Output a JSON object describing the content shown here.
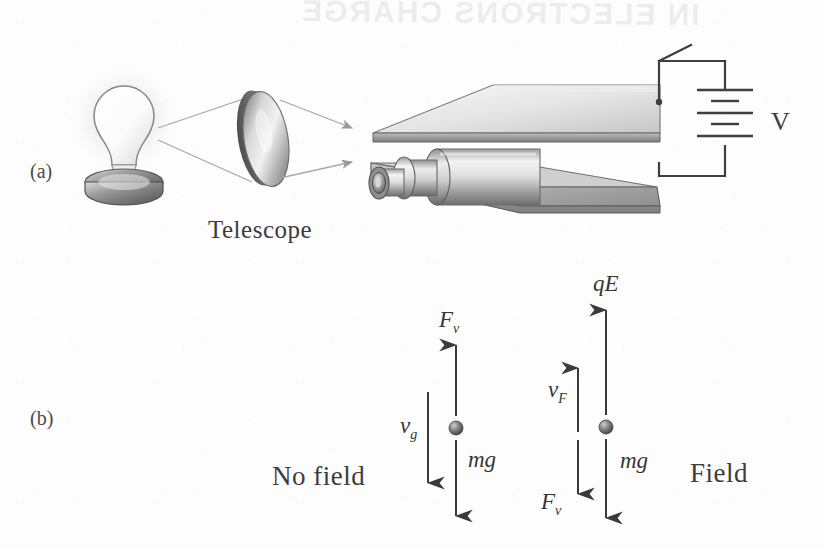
{
  "figure": {
    "background_color": "#fdfdfd",
    "ink_color": "#3c3c3c",
    "bleed_through_text": "IN ELECTRONS CHARGE"
  },
  "panels": {
    "a": {
      "label": "(a)",
      "caption": "Apparatus: lamp, lens, charged parallel plates, telescope and battery",
      "parts": {
        "lamp_label": "light-source",
        "lens_label": "converging-lens",
        "telescope_label": "Telescope",
        "voltage_label": "V",
        "switch_label": "switch",
        "plate_top_label": "upper-plate",
        "plate_bottom_label": "lower-plate",
        "drop_label": "oil-drop"
      }
    },
    "b": {
      "label": "(b)",
      "caption": "Force diagrams for an oil drop with no field and with field",
      "no_field": {
        "title": "No field",
        "forces": [
          {
            "symbol": "F",
            "sub": "v",
            "direction": "up",
            "name": "viscous-drag-force"
          },
          {
            "symbol": "mg",
            "sub": "",
            "direction": "down",
            "name": "gravitational-force"
          }
        ],
        "velocity": {
          "symbol": "v",
          "sub": "g",
          "direction": "down",
          "name": "terminal-velocity-gravity"
        }
      },
      "field": {
        "title": "Field",
        "forces": [
          {
            "symbol": "qE",
            "sub": "",
            "direction": "up",
            "name": "electric-force"
          },
          {
            "symbol": "F",
            "sub": "v",
            "direction": "down",
            "name": "viscous-drag-force"
          },
          {
            "symbol": "mg",
            "sub": "",
            "direction": "down",
            "name": "gravitational-force"
          }
        ],
        "velocity": {
          "symbol": "v",
          "sub": "F",
          "direction": "up",
          "name": "terminal-velocity-field"
        }
      }
    }
  },
  "labels": {
    "panel_a": "(a)",
    "panel_b": "(b)",
    "telescope": "Telescope",
    "voltage": "V",
    "no_field": "No field",
    "field": "Field",
    "Fv_left_sym": "F",
    "Fv_left_sub": "v",
    "vg_sym": "v",
    "vg_sub": "g",
    "mg_left": "mg",
    "qE": "qE",
    "vF_sym": "v",
    "vF_sub": "F",
    "Fv_right_sym": "F",
    "Fv_right_sub": "v",
    "mg_right": "mg"
  }
}
